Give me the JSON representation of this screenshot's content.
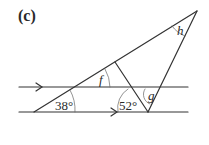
{
  "figure": {
    "part_label": "(c)",
    "angles": {
      "given_left": "38°",
      "given_middle": "52°",
      "unknown_f": "f",
      "unknown_g": "g",
      "unknown_h": "h"
    },
    "line_color": "#333333",
    "parallel_marker": "arrow"
  }
}
